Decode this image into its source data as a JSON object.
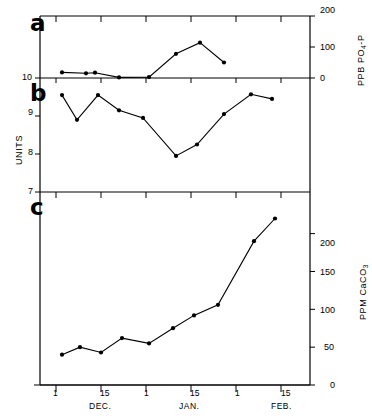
{
  "figure": {
    "title": "",
    "panels": [
      {
        "letter": "a",
        "axis_label": "PPB PO4-P",
        "axis_label_prefix": "PPB PO",
        "axis_label_sub": "4",
        "axis_label_suffix": "-P",
        "ticks": [
          "200",
          "100",
          "0"
        ]
      },
      {
        "letter": "b",
        "axis_label": "UNITS",
        "ticks": [
          "10",
          "9",
          "8",
          "7"
        ]
      },
      {
        "letter": "c",
        "axis_label": "PPM CaCO3",
        "axis_label_prefix": "PPM CaCO",
        "axis_label_sub": "3",
        "ticks": [
          "200",
          "150",
          "100",
          "50",
          "0"
        ]
      }
    ]
  },
  "xaxis": {
    "tick_labels": [
      "1",
      "15",
      "1",
      "15",
      "1",
      "15"
    ],
    "month_labels": [
      "DEC.",
      "JAN.",
      "FEB."
    ]
  },
  "chart_data": [
    {
      "type": "line",
      "panel": "a",
      "title": "a",
      "xlabel": "",
      "ylabel": "PPB PO4-P",
      "ylim": [
        0,
        200
      ],
      "yticks": [
        0,
        100,
        200
      ],
      "grid": false,
      "legend": "none",
      "x": [
        "Dec 3",
        "Dec 11",
        "Dec 14",
        "Dec 22",
        "Jan 1",
        "Jan 10",
        "Jan 18",
        "Jan 26"
      ],
      "values": [
        18,
        15,
        17,
        2,
        3,
        78,
        114,
        50
      ]
    },
    {
      "type": "line",
      "panel": "b",
      "title": "b",
      "xlabel": "",
      "ylabel": "UNITS",
      "ylim": [
        7,
        10
      ],
      "yticks": [
        7,
        8,
        9,
        10
      ],
      "grid": false,
      "legend": "none",
      "x": [
        "Dec 3",
        "Dec 8",
        "Dec 15",
        "Dec 22",
        "Dec 30",
        "Jan 10",
        "Jan 17",
        "Jan 26",
        "Feb 4",
        "Feb 11"
      ],
      "values": [
        9.55,
        8.9,
        9.55,
        9.15,
        8.95,
        7.95,
        8.25,
        9.05,
        9.57,
        9.45
      ]
    },
    {
      "type": "line",
      "panel": "c",
      "title": "c",
      "xlabel": "",
      "ylabel": "PPM CaCO3",
      "ylim": [
        0,
        225
      ],
      "yticks": [
        0,
        50,
        100,
        150,
        200
      ],
      "grid": false,
      "legend": "none",
      "x": [
        "Dec 3",
        "Dec 9",
        "Dec 16",
        "Dec 23",
        "Jan 1",
        "Jan 9",
        "Jan 16",
        "Jan 24",
        "Feb 5",
        "Feb 12"
      ],
      "values": [
        40,
        50,
        43,
        62,
        55,
        75,
        92,
        106,
        190,
        220
      ]
    }
  ],
  "style": {
    "line_color": "#000000",
    "marker_color": "#000000",
    "axis_color": "#000000",
    "background": "#ffffff"
  }
}
